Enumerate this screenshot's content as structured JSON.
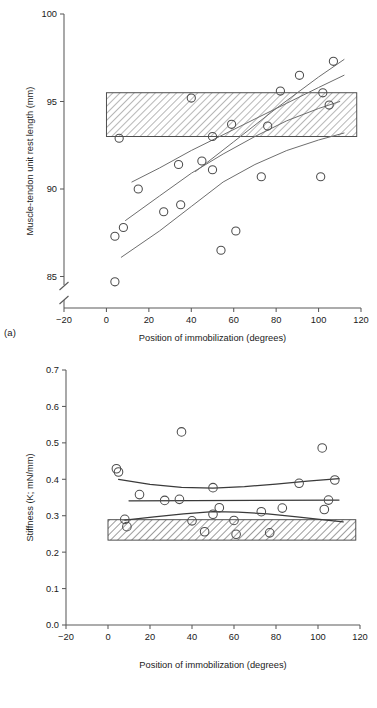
{
  "figure": {
    "panel_a_tag": "(a)",
    "panel_b_tag": "(b)"
  },
  "chart_data": [
    {
      "type": "scatter",
      "panel": "(a)",
      "title": "",
      "xlabel": "Position of immobilization (degrees)",
      "ylabel": "Muscle-tendon unit rest length (mm)",
      "xlim": [
        -20,
        120
      ],
      "ylim": [
        83.2,
        100
      ],
      "xticks": [
        -20,
        0,
        20,
        40,
        60,
        80,
        100,
        120
      ],
      "xtick_labels": [
        "−20",
        "0",
        "20",
        "40",
        "60",
        "80",
        "100",
        "120"
      ],
      "yticks": [
        85,
        90,
        95,
        100
      ],
      "ytick_labels": [
        "85",
        "90",
        "95",
        "100"
      ],
      "y_axis_break": true,
      "grid": false,
      "legend": "none",
      "reference_band": {
        "label": "control range band (hatched)",
        "y_min": 93.0,
        "y_max": 95.5,
        "x_min": 0,
        "x_max": 118,
        "hatch": "diagonal"
      },
      "points": [
        {
          "x": 4,
          "y": 87.3
        },
        {
          "x": 4,
          "y": 84.7
        },
        {
          "x": 6,
          "y": 92.9
        },
        {
          "x": 8,
          "y": 87.8
        },
        {
          "x": 15,
          "y": 90.0
        },
        {
          "x": 27,
          "y": 88.7
        },
        {
          "x": 34,
          "y": 91.4
        },
        {
          "x": 35,
          "y": 89.1
        },
        {
          "x": 40,
          "y": 95.2
        },
        {
          "x": 45,
          "y": 91.6
        },
        {
          "x": 50,
          "y": 91.1
        },
        {
          "x": 50,
          "y": 93.0
        },
        {
          "x": 54,
          "y": 86.5
        },
        {
          "x": 59,
          "y": 93.7
        },
        {
          "x": 61,
          "y": 87.6
        },
        {
          "x": 73,
          "y": 90.7
        },
        {
          "x": 76,
          "y": 93.6
        },
        {
          "x": 82,
          "y": 95.6
        },
        {
          "x": 91,
          "y": 96.5
        },
        {
          "x": 101,
          "y": 90.7
        },
        {
          "x": 102,
          "y": 95.5
        },
        {
          "x": 105,
          "y": 94.8
        },
        {
          "x": 107,
          "y": 97.3
        }
      ],
      "series": [
        {
          "name": "upper fitted curve",
          "x": [
            12,
            25,
            40,
            55,
            70,
            85,
            100,
            112
          ],
          "values": [
            90.4,
            91.2,
            92.2,
            93.1,
            94.0,
            94.9,
            95.8,
            96.5
          ]
        },
        {
          "name": "middle fitted curve",
          "x": [
            9,
            25,
            40,
            55,
            70,
            85,
            100,
            110
          ],
          "values": [
            88.2,
            89.6,
            90.9,
            92.0,
            93.0,
            93.9,
            94.6,
            95.0
          ]
        },
        {
          "name": "lower fitted curve",
          "x": [
            7,
            25,
            40,
            55,
            70,
            85,
            100,
            112
          ],
          "values": [
            86.1,
            87.6,
            89.0,
            90.4,
            91.4,
            92.2,
            92.8,
            93.2
          ]
        },
        {
          "name": "steep fitted line",
          "x": [
            42,
            60,
            80,
            100,
            112
          ],
          "values": [
            91.0,
            92.7,
            94.6,
            96.4,
            97.4
          ]
        }
      ]
    },
    {
      "type": "scatter",
      "panel": "(b)",
      "title": "",
      "xlabel": "Position of immobilization (degrees)",
      "ylabel": "Stiffness (K; mN/mm)",
      "xlim": [
        -20,
        120
      ],
      "ylim": [
        0.0,
        0.7
      ],
      "xticks": [
        -20,
        0,
        20,
        40,
        60,
        80,
        100,
        120
      ],
      "xtick_labels": [
        "−20",
        "0",
        "20",
        "40",
        "60",
        "80",
        "100",
        "120"
      ],
      "yticks": [
        0.0,
        0.1,
        0.2,
        0.3,
        0.4,
        0.5,
        0.6,
        0.7
      ],
      "ytick_labels": [
        "0.0",
        "0.1",
        "0.2",
        "0.3",
        "0.4",
        "0.5",
        "0.6",
        "0.7"
      ],
      "y_axis_break": false,
      "grid": false,
      "legend": "none",
      "reference_band": {
        "label": "control range band (hatched)",
        "y_min": 0.233,
        "y_max": 0.289,
        "x_min": 0,
        "x_max": 118,
        "hatch": "diagonal"
      },
      "points": [
        {
          "x": 4,
          "y": 0.429
        },
        {
          "x": 5,
          "y": 0.42
        },
        {
          "x": 8,
          "y": 0.29
        },
        {
          "x": 9,
          "y": 0.27
        },
        {
          "x": 15,
          "y": 0.358
        },
        {
          "x": 27,
          "y": 0.342
        },
        {
          "x": 34,
          "y": 0.345
        },
        {
          "x": 35,
          "y": 0.53
        },
        {
          "x": 40,
          "y": 0.286
        },
        {
          "x": 46,
          "y": 0.256
        },
        {
          "x": 50,
          "y": 0.377
        },
        {
          "x": 50,
          "y": 0.304
        },
        {
          "x": 53,
          "y": 0.322
        },
        {
          "x": 60,
          "y": 0.287
        },
        {
          "x": 61,
          "y": 0.249
        },
        {
          "x": 73,
          "y": 0.311
        },
        {
          "x": 77,
          "y": 0.253
        },
        {
          "x": 83,
          "y": 0.321
        },
        {
          "x": 91,
          "y": 0.389
        },
        {
          "x": 102,
          "y": 0.486
        },
        {
          "x": 103,
          "y": 0.317
        },
        {
          "x": 105,
          "y": 0.343
        },
        {
          "x": 108,
          "y": 0.398
        }
      ],
      "series": [
        {
          "name": "upper fitted curve",
          "x": [
            5,
            20,
            35,
            50,
            65,
            80,
            95,
            110
          ],
          "values": [
            0.4,
            0.386,
            0.378,
            0.376,
            0.38,
            0.387,
            0.395,
            0.402
          ]
        },
        {
          "name": "middle fitted line",
          "x": [
            10,
            110
          ],
          "values": [
            0.341,
            0.343
          ]
        },
        {
          "name": "lower fitted curve",
          "x": [
            8,
            22,
            36,
            50,
            62,
            76,
            90,
            104,
            112
          ],
          "values": [
            0.288,
            0.297,
            0.305,
            0.311,
            0.31,
            0.305,
            0.297,
            0.288,
            0.283
          ]
        }
      ]
    }
  ]
}
